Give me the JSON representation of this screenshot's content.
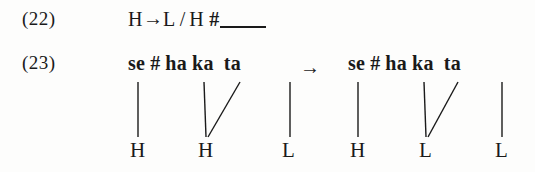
{
  "figure": {
    "background_color": "#fdfdfc",
    "text_color": "#1a1a1a"
  },
  "examples": [
    {
      "number": "(22)",
      "type": "rule",
      "rule": {
        "focus": "H",
        "arrow": "→",
        "change": "L",
        "slash": "/",
        "context_left": "H",
        "boundary": "#",
        "blank": "____"
      }
    },
    {
      "number": "(23)",
      "type": "derivation",
      "arrow": "→",
      "input": {
        "syllables": [
          "se",
          "#",
          "ha",
          "ka",
          "ta"
        ],
        "tones": [
          "H",
          "H",
          "L"
        ],
        "associations": [
          {
            "from_syllable": "se",
            "to_tone": "H",
            "kind": "vertical"
          },
          {
            "from_syllable": "ha",
            "to_tone": "H",
            "kind": "vertical"
          },
          {
            "from_syllable": "ka",
            "to_tone": "H",
            "kind": "diagonal"
          },
          {
            "from_syllable": "ta",
            "to_tone": "L",
            "kind": "vertical"
          }
        ]
      },
      "output": {
        "syllables": [
          "se",
          "#",
          "ha",
          "ka",
          "ta"
        ],
        "tones": [
          "H",
          "L",
          "L"
        ],
        "associations": [
          {
            "from_syllable": "se",
            "to_tone": "H",
            "kind": "vertical"
          },
          {
            "from_syllable": "ha",
            "to_tone": "L",
            "kind": "vertical"
          },
          {
            "from_syllable": "ka",
            "to_tone": "L",
            "kind": "diagonal"
          },
          {
            "from_syllable": "ta",
            "to_tone": "L",
            "kind": "vertical"
          }
        ]
      }
    }
  ],
  "labels": {
    "ex22_number": "(22)",
    "ex23_number": "(23)",
    "rule_focus": "H",
    "rule_arrow": "→",
    "rule_change": "L",
    "rule_slash": "/",
    "rule_context": "H",
    "rule_boundary": "#",
    "deriv_arrow": "→",
    "in_s1": "se",
    "in_bound": "#",
    "in_s2": "ha",
    "in_s3": "ka",
    "in_s4": "ta",
    "out_s1": "se",
    "out_bound": "#",
    "out_s2": "ha",
    "out_s3": "ka",
    "out_s4": "ta",
    "in_t1": "H",
    "in_t2": "H",
    "in_t3": "L",
    "out_t1": "H",
    "out_t2": "L",
    "out_t3": "L"
  }
}
